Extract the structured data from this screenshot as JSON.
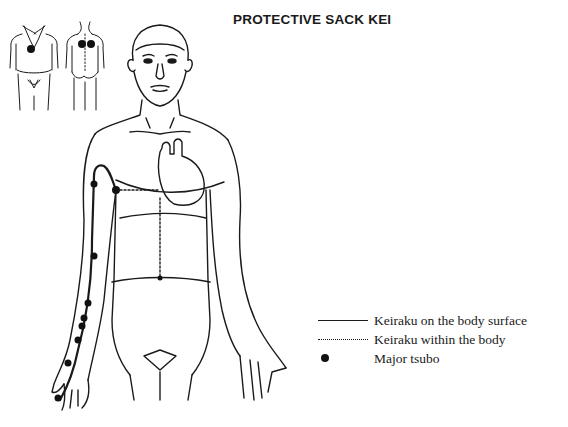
{
  "title": "PROTECTIVE SACK KEI",
  "figure": {
    "line_color": "#1a1a1a",
    "tsubo_color": "#111111"
  },
  "legend": {
    "items": [
      {
        "symbol": "solid-line",
        "label": "Keiraku on the body surface"
      },
      {
        "symbol": "dotted-line",
        "label": "Keiraku within the body"
      },
      {
        "symbol": "dot",
        "label": "Major tsubo"
      }
    ]
  }
}
